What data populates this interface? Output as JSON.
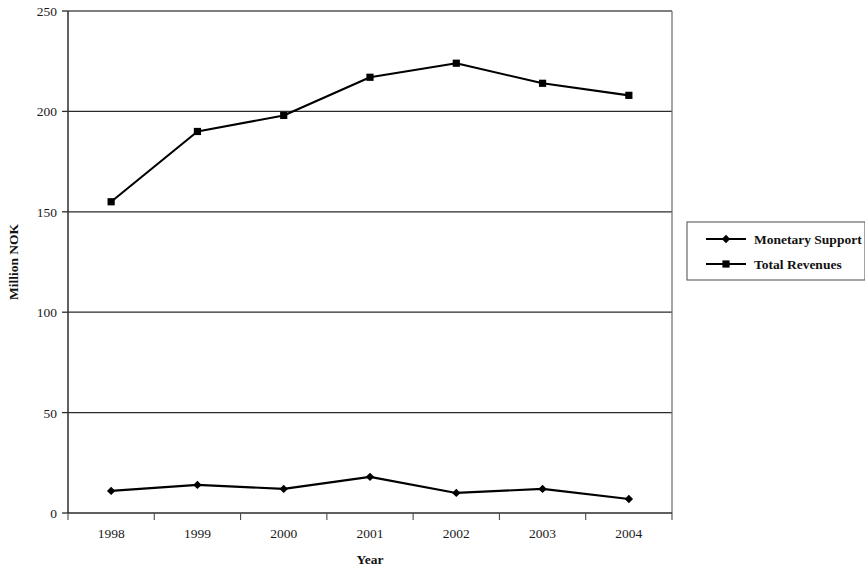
{
  "chart_data": {
    "type": "line",
    "title": "",
    "xlabel": "Year",
    "ylabel": "Million NOK",
    "categories": [
      "1998",
      "1999",
      "2000",
      "2001",
      "2002",
      "2003",
      "2004"
    ],
    "series": [
      {
        "name": "Monetary Support",
        "marker": "diamond",
        "color": "#000000",
        "values": [
          11,
          14,
          12,
          18,
          10,
          12,
          7
        ]
      },
      {
        "name": "Total Revenues",
        "marker": "square",
        "color": "#000000",
        "values": [
          155,
          190,
          198,
          217,
          224,
          214,
          208
        ]
      }
    ],
    "ylim": [
      0,
      250
    ],
    "yticks": [
      0,
      50,
      100,
      150,
      200,
      250
    ],
    "ytick_labels": [
      "0",
      "50",
      "100",
      "150",
      "200",
      "250"
    ],
    "grid": "horizontal",
    "legend_position": "right"
  },
  "axes": {
    "y_title": "Million NOK",
    "x_title": "Year"
  },
  "legend": {
    "entries": [
      {
        "label": "Monetary Support",
        "marker": "diamond-marker"
      },
      {
        "label": "Total Revenues",
        "marker": "square-marker"
      }
    ]
  }
}
